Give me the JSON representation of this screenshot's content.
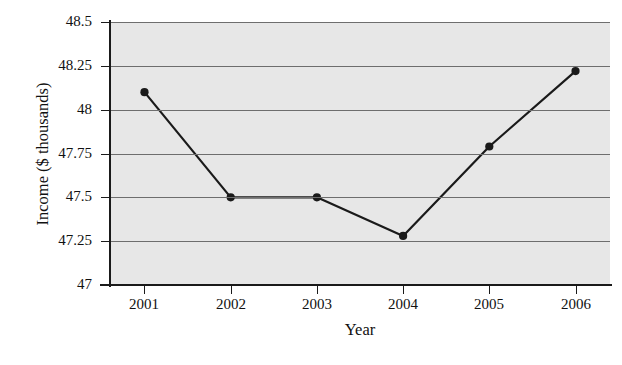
{
  "chart_data": {
    "type": "line",
    "title": "",
    "xlabel": "Year",
    "ylabel": "Income ($ thousands)",
    "categories": [
      "2001",
      "2002",
      "2003",
      "2004",
      "2005",
      "2006"
    ],
    "x": [
      2001,
      2002,
      2003,
      2004,
      2005,
      2006
    ],
    "values": [
      48.1,
      47.5,
      47.5,
      47.28,
      47.79,
      48.22
    ],
    "series": [
      {
        "name": "Income",
        "values": [
          48.1,
          47.5,
          47.5,
          47.28,
          47.79,
          48.22
        ]
      }
    ],
    "ylim": [
      47,
      48.5
    ],
    "xlim": [
      2000.6,
      2006.4
    ],
    "y_ticks": [
      47,
      47.25,
      47.5,
      47.75,
      48,
      48.25,
      48.5
    ],
    "y_tick_labels": [
      "47",
      "47.25",
      "47.5",
      "47.75",
      "48",
      "48.25",
      "48.5"
    ],
    "x_ticks": [
      2001,
      2002,
      2003,
      2004,
      2005,
      2006
    ],
    "x_tick_labels": [
      "2001",
      "2002",
      "2003",
      "2004",
      "2005",
      "2006"
    ],
    "grid": true,
    "grid_axis": "y",
    "legend": false,
    "legend_position": "none",
    "plot_background": "#e7e7e7",
    "figure_background": "#ffffff",
    "line_color": "#1a1a1a",
    "marker_color": "#1a1a1a",
    "marker": "circle",
    "marker_size": 6,
    "line_width": 2.2,
    "annotations": []
  },
  "axes": {
    "y_title": "Income ($ thousands)",
    "x_title": "Year"
  }
}
